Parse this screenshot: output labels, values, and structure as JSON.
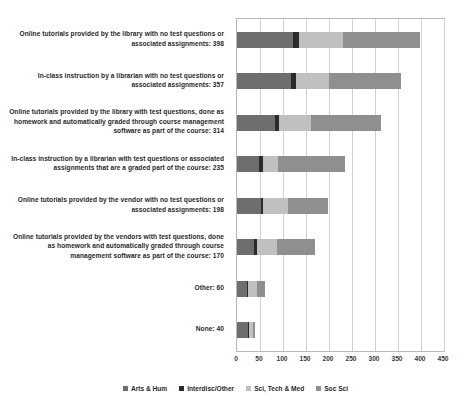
{
  "chart_title": "",
  "chart_data": {
    "type": "bar",
    "orientation": "horizontal",
    "stacked": true,
    "title": "",
    "xlabel": "",
    "ylabel": "",
    "xlim": [
      0,
      450
    ],
    "xticks": [
      0,
      50,
      100,
      150,
      200,
      250,
      300,
      350,
      400,
      450
    ],
    "grid": true,
    "legend_position": "bottom",
    "categories": [
      "Online tutorials provided by the library with no test questions or associated assignments: 398",
      "In-class instruction by a librarian with no test questions or associated assignments: 357",
      "Online tutorials provided by the library with test questions, done as homework and automatically graded through course management software as part of the course: 314",
      "In-class instruction by a librarian with test questions or associated assignments that are a graded part of the course: 235",
      "Online tutorials provided by the vendor with no test questions or associated assignments: 198",
      "Online tutorials provided by the vendors with test questions, done as homework and automatically graded through course management software as part of the course: 170",
      "Other: 60",
      "None: 40"
    ],
    "totals": [
      398,
      357,
      314,
      235,
      198,
      170,
      60,
      40
    ],
    "series": [
      {
        "name": "Arts & Hum",
        "color": "#6e6e6e",
        "values": [
          122,
          118,
          82,
          48,
          52,
          38,
          22,
          24
        ]
      },
      {
        "name": "Interdisc/Other",
        "color": "#2b2b2b",
        "values": [
          13,
          11,
          10,
          8,
          4,
          5,
          3,
          2
        ]
      },
      {
        "name": "Sci, Tech & Med",
        "color": "#c0c0c0",
        "values": [
          96,
          70,
          68,
          34,
          56,
          44,
          18,
          8
        ]
      },
      {
        "name": "Soc Sci",
        "color": "#8f8f8f",
        "values": [
          167,
          158,
          154,
          145,
          86,
          83,
          17,
          6
        ]
      }
    ]
  },
  "legend": {
    "items": [
      {
        "label": "Arts & Hum",
        "color": "#6e6e6e"
      },
      {
        "label": "Interdisc/Other",
        "color": "#2b2b2b"
      },
      {
        "label": "Sci, Tech & Med",
        "color": "#c0c0c0"
      },
      {
        "label": "Soc Sci",
        "color": "#8f8f8f"
      }
    ]
  }
}
